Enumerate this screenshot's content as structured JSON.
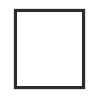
{
  "canvas": {
    "width": 93,
    "height": 97,
    "background_color": "#ffffff"
  },
  "shape": {
    "name": "empty-square-outline",
    "type": "rectangle",
    "fill_color": "#ffffff",
    "stroke_color": "#2b2b2b",
    "stroke_width": 3,
    "x": 14,
    "y": 9,
    "width": 71,
    "height": 80,
    "interior_content": ""
  }
}
